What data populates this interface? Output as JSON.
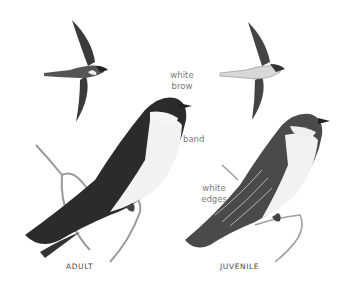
{
  "illustration": {
    "subject": "Tree Swallow plate",
    "figures": [
      {
        "id": "adult-flight",
        "caption": ""
      },
      {
        "id": "juvenile-flight",
        "caption": ""
      },
      {
        "id": "adult-perched",
        "caption": "ADULT"
      },
      {
        "id": "juvenile-perched",
        "caption": "JUVENILE"
      }
    ],
    "annotations": {
      "white_brow_1": "white",
      "white_brow_2": "brow",
      "band": "band",
      "white_edges_1": "white",
      "white_edges_2": "edges"
    },
    "colors": {
      "dark": "#2b2b2b",
      "mid": "#6a6a6a",
      "light": "#e8e8e8",
      "branch": "#9a9a9a",
      "label": "#7a7a7a"
    }
  }
}
